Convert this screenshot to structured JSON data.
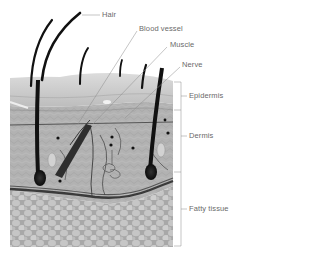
{
  "diagram": {
    "structure_labels": {
      "hair": "Hair",
      "blood_vessel": "Blood vessel",
      "muscle": "Muscle",
      "nerve": "Nerve"
    },
    "layer_labels": {
      "epidermis": "Epidermis",
      "dermis": "Dermis",
      "fatty_tissue": "Fatty tissue"
    },
    "colors": {
      "label_text": "#6a6a6a",
      "leader_line": "#8a8a8a",
      "epidermis": "#c9c9c9",
      "dermis": "#a9a9a9",
      "fat": "#b8b8b8",
      "hair": "#1a1a1a",
      "vessel": "#3a3a3a"
    }
  }
}
